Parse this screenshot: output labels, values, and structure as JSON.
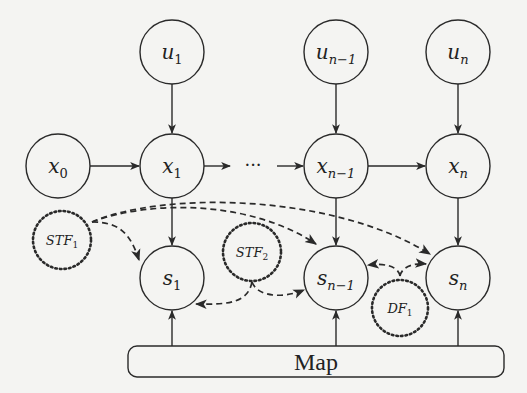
{
  "diagram": {
    "type": "graphical-model",
    "colors": {
      "stroke": "#2a2a2a",
      "background": "#f4f4f2"
    },
    "nodes": {
      "u1": {
        "base": "u",
        "sub": "1"
      },
      "un1": {
        "base": "u",
        "sub": "n−1"
      },
      "un": {
        "base": "u",
        "sub": "n"
      },
      "x0": {
        "base": "x",
        "sub": "0"
      },
      "x1": {
        "base": "x",
        "sub": "1"
      },
      "xn1": {
        "base": "x",
        "sub": "n−1"
      },
      "xn": {
        "base": "x",
        "sub": "n"
      },
      "s1": {
        "base": "s",
        "sub": "1"
      },
      "sn1": {
        "base": "s",
        "sub": "n−1"
      },
      "sn": {
        "base": "s",
        "sub": "n"
      },
      "stf1": {
        "base": "STF",
        "sub": "1"
      },
      "stf2": {
        "base": "STF",
        "sub": "2"
      },
      "df1": {
        "base": "DF",
        "sub": "1"
      }
    },
    "ellipsis": "···",
    "map_label": "Map",
    "edges": [
      {
        "from": "u1",
        "to": "x1",
        "style": "solid"
      },
      {
        "from": "un1",
        "to": "xn1",
        "style": "solid"
      },
      {
        "from": "un",
        "to": "xn",
        "style": "solid"
      },
      {
        "from": "x0",
        "to": "x1",
        "style": "solid"
      },
      {
        "from": "x1",
        "to": "ellipsis",
        "style": "solid"
      },
      {
        "from": "ellipsis",
        "to": "xn1",
        "style": "solid"
      },
      {
        "from": "xn1",
        "to": "xn",
        "style": "solid"
      },
      {
        "from": "x1",
        "to": "s1",
        "style": "solid"
      },
      {
        "from": "xn1",
        "to": "sn1",
        "style": "solid"
      },
      {
        "from": "xn",
        "to": "sn",
        "style": "solid"
      },
      {
        "from": "Map",
        "to": "s1",
        "style": "solid"
      },
      {
        "from": "Map",
        "to": "sn1",
        "style": "solid"
      },
      {
        "from": "Map",
        "to": "sn",
        "style": "solid"
      },
      {
        "from": "stf1",
        "to": "s1",
        "style": "dashed"
      },
      {
        "from": "stf1",
        "to": "sn1",
        "style": "dashed"
      },
      {
        "from": "stf1",
        "to": "sn",
        "style": "dashed"
      },
      {
        "from": "stf2",
        "to": "s1",
        "style": "dashed"
      },
      {
        "from": "stf2",
        "to": "sn1",
        "style": "dashed"
      },
      {
        "from": "df1",
        "to": "sn1",
        "style": "dashed"
      },
      {
        "from": "df1",
        "to": "sn",
        "style": "dashed"
      }
    ]
  }
}
